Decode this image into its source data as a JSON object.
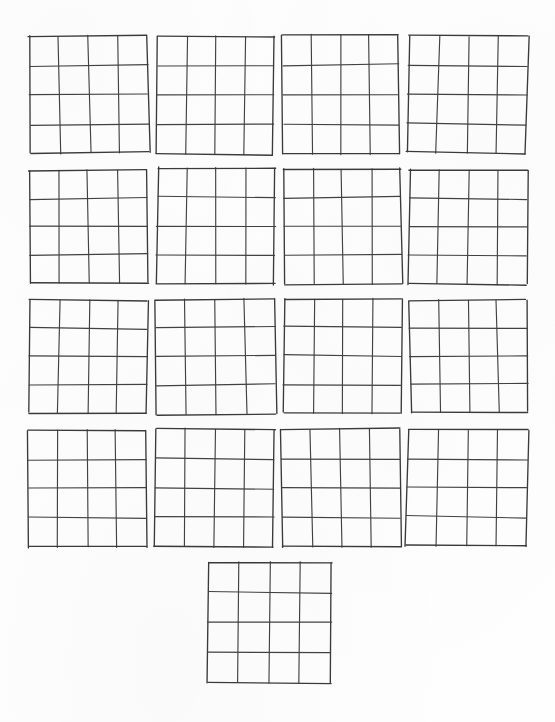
{
  "document": {
    "title": "Blank 4x4 Grid Worksheet",
    "page_width": 555,
    "page_height": 722,
    "background_color": "#fefefe",
    "line_color": "#414141",
    "grid_count": 17,
    "rows": 5,
    "description": "Scanned sheet of hand-drawn empty four-by-four square grids"
  },
  "grid_spec": {
    "columns": 4,
    "rows": 4,
    "cell_text": ""
  },
  "grids": [
    {
      "id": "grid-r1-c1",
      "row": 1,
      "col": 1,
      "x": 30,
      "y": 36,
      "w": 118,
      "h": 117,
      "rotate": -0.5,
      "skew": 0.6
    },
    {
      "id": "grid-r1-c2",
      "row": 1,
      "col": 2,
      "x": 157,
      "y": 36,
      "w": 117,
      "h": 118,
      "rotate": 0.3,
      "skew": -0.4
    },
    {
      "id": "grid-r1-c3",
      "row": 1,
      "col": 3,
      "x": 283,
      "y": 35,
      "w": 116,
      "h": 119,
      "rotate": -0.2,
      "skew": 0.3
    },
    {
      "id": "grid-r1-c4",
      "row": 1,
      "col": 4,
      "x": 408,
      "y": 36,
      "w": 119,
      "h": 117,
      "rotate": 0.5,
      "skew": -0.6
    },
    {
      "id": "grid-r2-c1",
      "row": 2,
      "col": 1,
      "x": 30,
      "y": 170,
      "w": 117,
      "h": 113,
      "rotate": -0.4,
      "skew": 0.5
    },
    {
      "id": "grid-r2-c2",
      "row": 2,
      "col": 2,
      "x": 157,
      "y": 168,
      "w": 118,
      "h": 116,
      "rotate": 0.4,
      "skew": -0.3
    },
    {
      "id": "grid-r2-c3",
      "row": 2,
      "col": 3,
      "x": 284,
      "y": 169,
      "w": 117,
      "h": 115,
      "rotate": -0.3,
      "skew": 0.4
    },
    {
      "id": "grid-r2-c4",
      "row": 2,
      "col": 4,
      "x": 409,
      "y": 170,
      "w": 118,
      "h": 114,
      "rotate": 0.2,
      "skew": -0.5
    },
    {
      "id": "grid-r3-c1",
      "row": 3,
      "col": 1,
      "x": 29,
      "y": 300,
      "w": 118,
      "h": 113,
      "rotate": 0.4,
      "skew": -0.4
    },
    {
      "id": "grid-r3-c2",
      "row": 3,
      "col": 2,
      "x": 156,
      "y": 299,
      "w": 119,
      "h": 115,
      "rotate": -0.4,
      "skew": 0.5
    },
    {
      "id": "grid-r3-c3",
      "row": 3,
      "col": 3,
      "x": 284,
      "y": 299,
      "w": 117,
      "h": 114,
      "rotate": 0.3,
      "skew": -0.3
    },
    {
      "id": "grid-r3-c4",
      "row": 3,
      "col": 4,
      "x": 410,
      "y": 300,
      "w": 117,
      "h": 112,
      "rotate": -0.5,
      "skew": 0.4
    },
    {
      "id": "grid-r4-c1",
      "row": 4,
      "col": 1,
      "x": 28,
      "y": 430,
      "w": 118,
      "h": 117,
      "rotate": -0.3,
      "skew": 0.5
    },
    {
      "id": "grid-r4-c2",
      "row": 4,
      "col": 2,
      "x": 155,
      "y": 429,
      "w": 119,
      "h": 118,
      "rotate": 0.4,
      "skew": -0.5
    },
    {
      "id": "grid-r4-c3",
      "row": 4,
      "col": 3,
      "x": 282,
      "y": 429,
      "w": 118,
      "h": 118,
      "rotate": -0.2,
      "skew": 0.3
    },
    {
      "id": "grid-r4-c4",
      "row": 4,
      "col": 4,
      "x": 407,
      "y": 430,
      "w": 120,
      "h": 116,
      "rotate": 0.5,
      "skew": -0.4
    },
    {
      "id": "grid-r5-c1",
      "row": 5,
      "col": 1,
      "x": 208,
      "y": 562,
      "w": 123,
      "h": 121,
      "rotate": 0.2,
      "skew": -0.3
    }
  ]
}
